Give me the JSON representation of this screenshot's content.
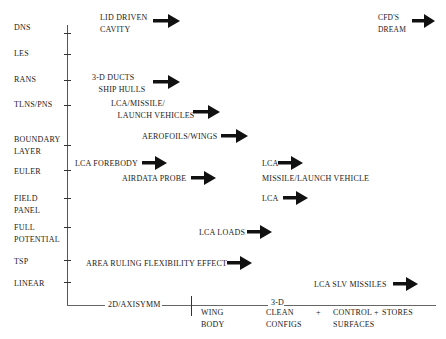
{
  "diagram": {
    "y_axis_levels": [
      {
        "label": "DNS",
        "y": 28
      },
      {
        "label": "LES",
        "y": 54
      },
      {
        "label": "RANS",
        "y": 80
      },
      {
        "label": "TLNS/PNS",
        "y": 105
      },
      {
        "label": "BOUNDARY\nLAYER",
        "y": 146
      },
      {
        "label": "EULER",
        "y": 170
      },
      {
        "label": "FIELD\nPANEL",
        "y": 198
      },
      {
        "label": "FULL\nPOTENTIAL",
        "y": 227
      },
      {
        "label": "TSP",
        "y": 260
      },
      {
        "label": "LINEAR",
        "y": 282
      }
    ],
    "applications": [
      {
        "text": "LID DRIVEN\nCAVITY",
        "x": 100,
        "y": 13,
        "arrow_x": 153,
        "arrow_y": 21
      },
      {
        "text": "CFD'S\nDREAM",
        "x": 378,
        "y": 13,
        "arrow_x": 412,
        "arrow_y": 21
      },
      {
        "text": "3-D DUCTS\n   SHIP HULLS",
        "x": 92,
        "y": 73,
        "arrow_x": 153,
        "arrow_y": 82
      },
      {
        "text": "LCA/MISSILE/\n   LAUNCH VEHICLES",
        "x": 111,
        "y": 98,
        "arrow_x": 193,
        "arrow_y": 112
      },
      {
        "text": "AEROFOILS/WINGS",
        "x": 142,
        "y": 132,
        "arrow_x": 221,
        "arrow_y": 136
      },
      {
        "text": "LCA FOREBODY",
        "x": 75,
        "y": 159,
        "arrow_x": 142,
        "arrow_y": 163
      },
      {
        "text": "AIRDATA PROBE",
        "x": 122,
        "y": 174,
        "arrow_x": 191,
        "arrow_y": 178
      },
      {
        "text": "LCA",
        "x": 262,
        "y": 159,
        "arrow_x": 278,
        "arrow_y": 163
      },
      {
        "text": "MISSILE/LAUNCH VEHICLE",
        "x": 262,
        "y": 174,
        "arrow_x": null,
        "arrow_y": null
      },
      {
        "text": "LCA",
        "x": 262,
        "y": 194,
        "arrow_x": 283,
        "arrow_y": 198
      },
      {
        "text": "LCA LOADS",
        "x": 199,
        "y": 228,
        "arrow_x": 247,
        "arrow_y": 232
      },
      {
        "text": "AREA RULING FLEXIBILITY EFFECT",
        "x": 86,
        "y": 259,
        "arrow_x": 227,
        "arrow_y": 263
      },
      {
        "text": "LCA SLV MISSILES",
        "x": 314,
        "y": 280,
        "arrow_x": 393,
        "arrow_y": 284
      }
    ],
    "x_axis": {
      "segment_2d": "2D/AXISYMM",
      "segment_3d": "3-D",
      "categories": [
        {
          "text": "WING\nBODY",
          "x": 201,
          "y": 307
        },
        {
          "text": "CLEAN\nCONFIGS",
          "x": 266,
          "y": 307
        },
        {
          "text": "+",
          "x": 318,
          "y": 307
        },
        {
          "text": "CONTROL +\nSURFACES",
          "x": 334,
          "y": 307
        },
        {
          "text": "STORES",
          "x": 383,
          "y": 307
        }
      ]
    },
    "colors": {
      "ink": "#1a1a1a",
      "axis": "#555555",
      "background": "#ffffff"
    }
  }
}
